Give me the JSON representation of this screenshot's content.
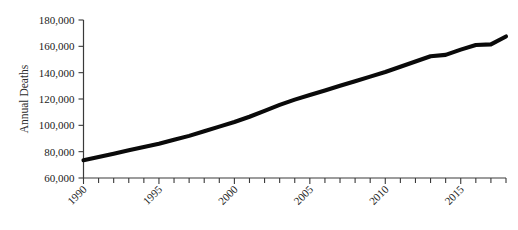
{
  "chart_data": {
    "type": "line",
    "title": "",
    "subtitle": "",
    "xlabel": "",
    "ylabel": "Annual Deaths",
    "xlim": [
      1990,
      2018
    ],
    "ylim": [
      60000,
      180000
    ],
    "grid": false,
    "legend": null,
    "legend_position": "none",
    "line_color": "#0a0a0a",
    "axis_color": "#3a3a3a",
    "background_color": "#ffffff",
    "ytick_labels": [
      "60,000",
      "80,000",
      "100,000",
      "120,000",
      "140,000",
      "160,000",
      "180,000"
    ],
    "ytick_values": [
      60000,
      80000,
      100000,
      120000,
      140000,
      160000,
      180000
    ],
    "xtick_labels": [
      "1990",
      "1995",
      "2000",
      "2005",
      "2010",
      "2015"
    ],
    "xtick_values": [
      1990,
      1995,
      2000,
      2005,
      2010,
      2015
    ],
    "xtick_label_rotation": -45,
    "xminor_tick_interval": 1,
    "x": [
      1990,
      1991,
      1992,
      1993,
      1994,
      1995,
      1996,
      1997,
      1998,
      1999,
      2000,
      2001,
      2002,
      2003,
      2004,
      2005,
      2006,
      2007,
      2008,
      2009,
      2010,
      2011,
      2012,
      2013,
      2014,
      2015,
      2016,
      2017,
      2018
    ],
    "values": [
      73500,
      76000,
      78500,
      81000,
      83500,
      86000,
      89000,
      92000,
      95500,
      99000,
      102500,
      106500,
      111000,
      115500,
      119500,
      123000,
      126500,
      130000,
      133500,
      137000,
      140500,
      144500,
      148500,
      152500,
      153500,
      157500,
      161000,
      161500,
      167500
    ],
    "series": [
      {
        "name": "Annual Deaths",
        "values": [
          73500,
          76000,
          78500,
          81000,
          83500,
          86000,
          89000,
          92000,
          95500,
          99000,
          102500,
          106500,
          111000,
          115500,
          119500,
          123000,
          126500,
          130000,
          133500,
          137000,
          140500,
          144500,
          148500,
          152500,
          153500,
          157500,
          161000,
          161500,
          167500
        ]
      }
    ]
  }
}
